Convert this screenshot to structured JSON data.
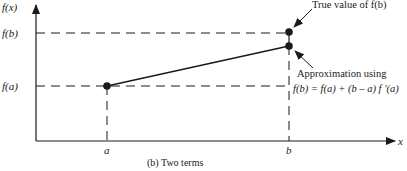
{
  "diagram": {
    "caption": "(b) Two terms",
    "axes": {
      "y_label": "f(x)",
      "x_label": "x"
    },
    "y_ticks": {
      "fb": "f(b)",
      "fa": "f(a)"
    },
    "x_ticks": {
      "a": "a",
      "b": "b"
    },
    "annotations": {
      "true_value": "True value of f(b)",
      "approx_line1": "Approximation using",
      "approx_line2": "f(b) = f(a) + (b – a) f ′(a)"
    },
    "colors": {
      "ink": "#1a1a1a",
      "background": "#ffffff"
    }
  }
}
